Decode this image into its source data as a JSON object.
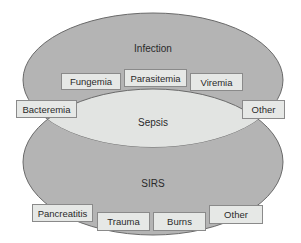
{
  "diagram": {
    "type": "venn",
    "colors": {
      "ellipse_fill": "#b4b4b4",
      "overlap_fill": "#e2e4e2",
      "outline": "#6a6a6a",
      "box_fill": "#e6e8e6",
      "box_border": "#8a8a8a"
    },
    "sets": {
      "infection": {
        "label": "Infection"
      },
      "sirs": {
        "label": "SIRS"
      },
      "overlap": {
        "label": "Sepsis"
      }
    },
    "infection_boxes": [
      {
        "label": "Fungemia"
      },
      {
        "label": "Parasitemia"
      },
      {
        "label": "Viremia"
      },
      {
        "label": "Bacteremia"
      },
      {
        "label": "Other"
      }
    ],
    "sirs_boxes": [
      {
        "label": "Pancreatitis"
      },
      {
        "label": "Trauma"
      },
      {
        "label": "Burns"
      },
      {
        "label": "Other"
      }
    ]
  }
}
